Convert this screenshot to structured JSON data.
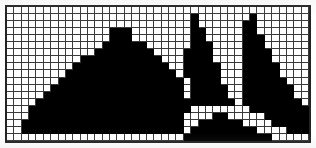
{
  "figure": {
    "kind": "rasterized-shapes-grid",
    "grid": {
      "columns": 41,
      "rows": 19,
      "cell_size_px": 7.2,
      "grid_line_color": "#3a3a3a",
      "frame_color": "#222222",
      "fill_color": "#000000",
      "background_color": "#ffffff",
      "grid_visible": true
    },
    "shapes": [
      {
        "name": "large-centered-triangle",
        "position": "left",
        "type": "isosceles-triangle",
        "apex_column": 14,
        "base_columns": [
          3,
          24
        ],
        "apex_row": 3,
        "base_row": 17
      },
      {
        "name": "left-sail-triangle",
        "position": "center",
        "type": "right-triangle-vertical-right-edge",
        "apex_column": 25,
        "apex_row": 1,
        "base_row": 13
      },
      {
        "name": "right-sail-triangle",
        "position": "right",
        "type": "right-triangle-vertical-left-edge",
        "apex_column": 33,
        "apex_row": 1,
        "base_row": 14
      },
      {
        "name": "flat-wide-triangle",
        "position": "bottom-center",
        "type": "obtuse-flat-triangle",
        "apex_column": 28,
        "apex_row": 14,
        "base_columns": [
          23,
          38
        ],
        "base_row": 18
      }
    ],
    "bitmap": [
      "00000000000000000000000000000000000000000",
      "00000000000000000000000001000000010000000",
      "00000000000000000000000001000000110000000",
      "00000000000000111000000001100000110000000",
      "00000000000000111000000001100000111000000",
      "00000000000001111110000001110000111000000",
      "00000000000011111111000011110000111100000",
      "00000000001111111111100011110000111100000",
      "00000000011111111111110011111000111110000",
      "00000000111111111111111011111000111110000",
      "00000001111111111111111101111000111111000",
      "00000011111111111111111101111100111111100",
      "00000111111111111111111101111100111111100",
      "00001111111111111111111111111110111111110",
      "00011111111111111111111110000000011111111",
      "00011111111111111111111100001100000111111",
      "00111111111111111111111100111111000011111",
      "00111111111111111111111101111111110000111",
      "00000000000000000000000011111111111100000"
    ]
  }
}
